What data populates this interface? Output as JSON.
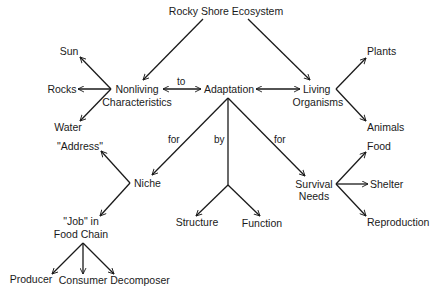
{
  "title": "Rocky Shore Ecosystem",
  "nodes": {
    "root": {
      "line1": "Rocky Shore Ecosystem"
    },
    "nonliving": {
      "line1": "Nonliving",
      "line2": "Characteristics"
    },
    "living": {
      "line1": "Living",
      "line2": "Organisms"
    },
    "adaptation": {
      "line1": "Adaptation"
    },
    "sun": {
      "line1": "Sun"
    },
    "rocks": {
      "line1": "Rocks"
    },
    "water": {
      "line1": "Water"
    },
    "plants": {
      "line1": "Plants"
    },
    "animals": {
      "line1": "Animals"
    },
    "niche": {
      "line1": "Niche"
    },
    "address": {
      "line1": "\"Address\""
    },
    "job": {
      "line1": "\"Job\" in",
      "line2": "Food Chain"
    },
    "producer": {
      "line1": "Producer"
    },
    "consumer": {
      "line1": "Consumer"
    },
    "decomposer": {
      "line1": "Decomposer"
    },
    "structure": {
      "line1": "Structure"
    },
    "function": {
      "line1": "Function"
    },
    "survival": {
      "line1": "Survival",
      "line2": "Needs"
    },
    "food": {
      "line1": "Food"
    },
    "shelter": {
      "line1": "Shelter"
    },
    "reproduction": {
      "line1": "Reproduction"
    }
  },
  "edge_labels": {
    "to": "to",
    "for_niche": "for",
    "by": "by",
    "for_survival": "for"
  },
  "edges": [
    {
      "from": "Rocky Shore Ecosystem",
      "to": "Nonliving Characteristics"
    },
    {
      "from": "Rocky Shore Ecosystem",
      "to": "Living Organisms"
    },
    {
      "from": "Nonliving Characteristics",
      "to": "Adaptation",
      "label": "to",
      "bidirectional": true
    },
    {
      "from": "Adaptation",
      "to": "Living Organisms",
      "bidirectional": true
    },
    {
      "from": "Nonliving Characteristics",
      "to": "Sun"
    },
    {
      "from": "Nonliving Characteristics",
      "to": "Rocks"
    },
    {
      "from": "Nonliving Characteristics",
      "to": "Water"
    },
    {
      "from": "Living Organisms",
      "to": "Plants"
    },
    {
      "from": "Living Organisms",
      "to": "Animals"
    },
    {
      "from": "Adaptation",
      "to": "Niche",
      "label": "for"
    },
    {
      "from": "Adaptation",
      "to": "Structure",
      "label": "by"
    },
    {
      "from": "Adaptation",
      "to": "Function",
      "label": "by"
    },
    {
      "from": "Adaptation",
      "to": "Survival Needs",
      "label": "for"
    },
    {
      "from": "Niche",
      "to": "\"Address\""
    },
    {
      "from": "Niche",
      "to": "\"Job\" in Food Chain"
    },
    {
      "from": "\"Job\" in Food Chain",
      "to": "Producer"
    },
    {
      "from": "\"Job\" in Food Chain",
      "to": "Consumer"
    },
    {
      "from": "\"Job\" in Food Chain",
      "to": "Decomposer"
    },
    {
      "from": "Survival Needs",
      "to": "Food"
    },
    {
      "from": "Survival Needs",
      "to": "Shelter"
    },
    {
      "from": "Survival Needs",
      "to": "Reproduction"
    }
  ]
}
